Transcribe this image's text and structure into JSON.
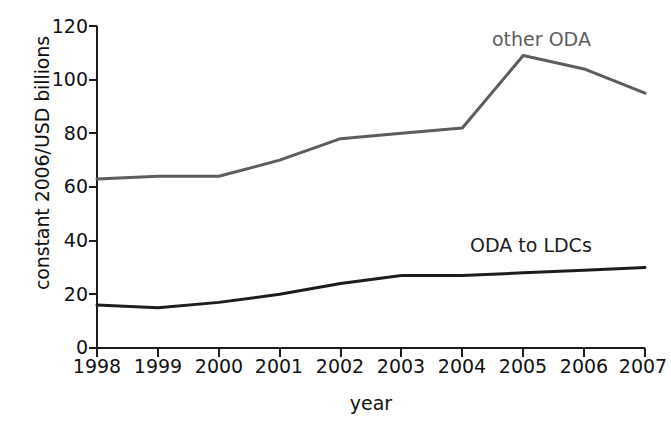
{
  "chart_data": {
    "type": "line",
    "title": "",
    "xlabel": "year",
    "ylabel": "constant 2006/USD billions",
    "x": [
      1998,
      1999,
      2000,
      2001,
      2002,
      2003,
      2004,
      2005,
      2006,
      2007
    ],
    "categories": [
      "1998",
      "1999",
      "2000",
      "2001",
      "2002",
      "2003",
      "2004",
      "2005",
      "2006",
      "2007"
    ],
    "xlim": [
      1998,
      2007
    ],
    "ylim": [
      0,
      120
    ],
    "yticks": [
      0,
      20,
      40,
      60,
      80,
      100,
      120
    ],
    "ytick_labels": [
      "0",
      "20",
      "40",
      "60",
      "80",
      "100",
      "120"
    ],
    "grid": false,
    "legend_position": "inline-annotation",
    "series": [
      {
        "name": "other ODA",
        "color": "#5c5c5c",
        "values": [
          63,
          64,
          64,
          70,
          78,
          80,
          82,
          109,
          104,
          95
        ],
        "label_text": "other ODA"
      },
      {
        "name": "ODA to LDCs",
        "color": "#1c1c1c",
        "values": [
          16,
          15,
          17,
          20,
          24,
          27,
          27,
          28,
          29,
          30
        ],
        "label_text": "ODA to LDCs"
      }
    ],
    "annotations": [
      {
        "text": "other ODA",
        "series": "other ODA"
      },
      {
        "text": "ODA to LDCs",
        "series": "ODA to LDCs"
      }
    ]
  },
  "axes": {
    "y_title": "constant 2006/USD billions",
    "x_title": "year",
    "y_tick_labels": [
      "120",
      "100",
      "80",
      "60",
      "40",
      "20",
      "0"
    ],
    "x_tick_labels": [
      "1998",
      "1999",
      "2000",
      "2001",
      "2002",
      "2003",
      "2004",
      "2005",
      "2006",
      "2007"
    ]
  },
  "labels": {
    "other_oda": "other ODA",
    "oda_to_ldcs": "ODA to LDCs"
  },
  "colors": {
    "other_oda_line": "#5c5c5c",
    "oda_ldcs_line": "#1c1c1c",
    "axis": "#1c1c1c",
    "background": "#ffffff"
  }
}
